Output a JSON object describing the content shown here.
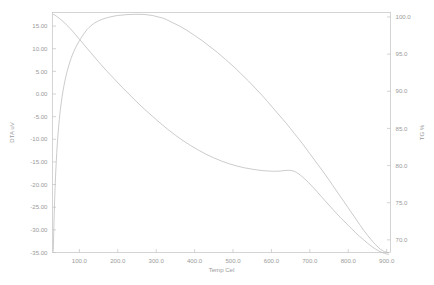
{
  "chart_data": {
    "type": "line",
    "title": "",
    "xlabel": "Temp Cel",
    "ylabel_left": "DTA uV",
    "ylabel_right": "TG %",
    "grid": false,
    "legend": "none",
    "xlim": [
      30,
      910
    ],
    "xticks": [
      "100.0",
      "200.0",
      "300.0",
      "400.0",
      "500.0",
      "600.0",
      "700.0",
      "800.0",
      "900.0"
    ],
    "xtick_values": [
      100,
      200,
      300,
      400,
      500,
      600,
      700,
      800,
      900
    ],
    "ylim_left": [
      -35,
      18
    ],
    "yticks_left": [
      "15.00",
      "10.00",
      "5.00",
      "0.00",
      "-5.00",
      "-10.00",
      "-15.00",
      "-20.00",
      "-25.00",
      "-30.00",
      "-35.00"
    ],
    "ytick_values_left": [
      15,
      10,
      5,
      0,
      -5,
      -10,
      -15,
      -20,
      -25,
      -30,
      -35
    ],
    "ylim_right": [
      68.3,
      100.6
    ],
    "yticks_right": [
      "100.0",
      "95.0",
      "90.0",
      "85.0",
      "80.0",
      "75.0",
      "70.0"
    ],
    "ytick_values_right": [
      100,
      95,
      90,
      85,
      80,
      75,
      70
    ],
    "series": [
      {
        "name": "DTA uV",
        "axis": "left",
        "color": "#b9b9b9",
        "x": [
          32,
          40,
          55,
          70,
          85,
          100,
          115,
          130,
          150,
          170,
          190,
          210,
          230,
          250,
          270,
          290,
          310,
          330,
          350,
          370,
          390,
          410,
          430,
          450,
          470,
          490,
          510,
          530,
          550,
          570,
          590,
          605,
          615,
          625,
          635,
          645,
          655,
          665,
          675,
          690,
          705,
          720,
          740,
          760,
          780,
          800,
          820,
          840,
          860,
          880,
          895,
          905
        ],
        "y": [
          17.6,
          17.2,
          16.2,
          15.0,
          13.6,
          12.1,
          10.6,
          9.1,
          7.1,
          5.2,
          3.4,
          1.6,
          -0.1,
          -1.8,
          -3.4,
          -4.9,
          -6.4,
          -7.8,
          -9.1,
          -10.3,
          -11.4,
          -12.4,
          -13.3,
          -14.1,
          -14.8,
          -15.4,
          -15.9,
          -16.3,
          -16.6,
          -16.85,
          -17.0,
          -17.05,
          -17.05,
          -17.0,
          -16.9,
          -16.85,
          -16.95,
          -17.3,
          -17.9,
          -19.0,
          -20.3,
          -21.7,
          -23.6,
          -25.5,
          -27.3,
          -29.0,
          -30.7,
          -32.2,
          -33.6,
          -34.7,
          -35.2,
          -35.4
        ]
      },
      {
        "name": "TG %",
        "axis": "right",
        "color": "#b9b9b9",
        "x": [
          32,
          36,
          42,
          50,
          60,
          72,
          85,
          100,
          120,
          140,
          160,
          180,
          200,
          220,
          240,
          260,
          275,
          290,
          305,
          320,
          340,
          360,
          380,
          400,
          420,
          440,
          460,
          480,
          500,
          520,
          540,
          560,
          580,
          600,
          620,
          640,
          660,
          680,
          700,
          720,
          740,
          760,
          780,
          800,
          820,
          840,
          860,
          880,
          895,
          905
        ],
        "y": [
          68.5,
          76.0,
          82.5,
          87.3,
          90.8,
          93.4,
          95.3,
          96.8,
          98.3,
          99.2,
          99.7,
          100.0,
          100.2,
          100.3,
          100.35,
          100.35,
          100.3,
          100.2,
          100.0,
          99.8,
          99.3,
          98.8,
          98.2,
          97.5,
          96.8,
          96.0,
          95.2,
          94.3,
          93.4,
          92.4,
          91.4,
          90.3,
          89.2,
          88.0,
          86.8,
          85.6,
          84.3,
          83.0,
          81.6,
          80.2,
          78.8,
          77.3,
          75.8,
          74.3,
          72.8,
          71.3,
          70.0,
          68.9,
          68.4,
          68.3
        ]
      }
    ]
  },
  "axes": {
    "x_label": "Temp Cel",
    "y_left_label": "DTA uV",
    "y_right_label": "TG %"
  }
}
